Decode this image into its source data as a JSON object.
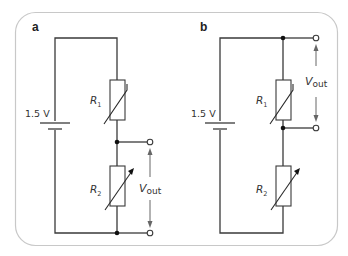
{
  "figure": {
    "border_color": "#c8c8c8",
    "wire_color": "#3a3a3a",
    "panels": [
      {
        "id": "a",
        "label": "a",
        "battery_label": "1.5 V",
        "r1": {
          "symbol": "R",
          "sub": "1",
          "type": "thermistor"
        },
        "r2": {
          "symbol": "R",
          "sub": "2",
          "type": "variable-resistor"
        },
        "output": {
          "symbol": "V",
          "sub": "out",
          "across": "R2"
        }
      },
      {
        "id": "b",
        "label": "b",
        "battery_label": "1.5 V",
        "r1": {
          "symbol": "R",
          "sub": "1",
          "type": "thermistor"
        },
        "r2": {
          "symbol": "R",
          "sub": "2",
          "type": "variable-resistor"
        },
        "output": {
          "symbol": "V",
          "sub": "out",
          "across": "R1"
        }
      }
    ]
  }
}
